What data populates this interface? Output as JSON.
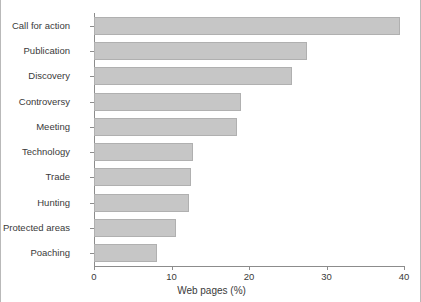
{
  "chart_data": {
    "type": "bar",
    "orientation": "horizontal",
    "title": "",
    "xlabel": "Web pages (%)",
    "ylabel": "",
    "xlim": [
      0,
      40
    ],
    "xticks": [
      0,
      10,
      20,
      30,
      40
    ],
    "xtick_labels": [
      "0",
      "10",
      "20",
      "30",
      "40"
    ],
    "grid": false,
    "legend": null,
    "bar_color": "#c6c6c6",
    "bar_edge_color": "#b0b0b0",
    "axis_color": "#8c8c8c",
    "text_color": "#3a3a3a",
    "categories": [
      "Call for action",
      "Publication",
      "Discovery",
      "Controversy",
      "Meeting",
      "Technology",
      "Trade",
      "Hunting",
      "Protected areas",
      "Poaching"
    ],
    "values": [
      39.5,
      27.5,
      25.5,
      19.0,
      18.4,
      12.8,
      12.5,
      12.2,
      10.6,
      8.1
    ]
  }
}
